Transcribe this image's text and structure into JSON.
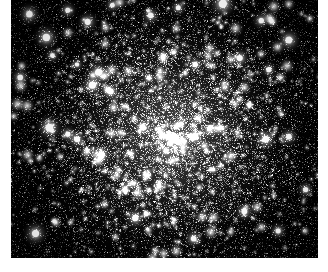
{
  "document": {
    "kind": "astronomical-photograph",
    "subject": "globular star cluster",
    "color_mode": "grayscale",
    "caption": "",
    "alt_text": "Dense grayscale field of thousands of stars forming a globular cluster, brightest and most crowded at the centre and thinning toward the edges, on a black sky background."
  },
  "plate": {
    "x": 11,
    "y": 0,
    "width": 307,
    "height": 258,
    "background_color": "#000000",
    "page_background_color": "#ffffff",
    "margin_left": 11,
    "margin_right": 10,
    "margin_bottom": 14,
    "margin_top": 0
  },
  "image_content": {
    "type": "star-field",
    "cluster_center_x_pct": 52,
    "cluster_center_y_pct": 52,
    "core_radius_pct": 20,
    "halo_radius_pct": 48,
    "faint_star_count": 9000,
    "mid_star_count": 900,
    "bright_star_count": 150,
    "very_bright_star_count": 34,
    "noise_grain_count": 14000,
    "sky_level": 4,
    "peak_brightness": 255,
    "palette": {
      "sky": "#000000",
      "grain_dark": "#0d0d0d",
      "grain_mid": "#3a3a3a",
      "star_faint": "#7a7a7a",
      "star_mid": "#bdbdbd",
      "star_bright": "#ffffff",
      "core_glow": "#969696"
    },
    "bright_stars": [
      {
        "x": 0.06,
        "y": 0.055,
        "r": 3.2,
        "i": 0.92
      },
      {
        "x": 0.115,
        "y": 0.145,
        "r": 3.6,
        "i": 0.98
      },
      {
        "x": 0.185,
        "y": 0.04,
        "r": 2.6,
        "i": 0.8
      },
      {
        "x": 0.25,
        "y": 0.085,
        "r": 3.0,
        "i": 0.88
      },
      {
        "x": 0.33,
        "y": 0.02,
        "r": 2.4,
        "i": 0.76
      },
      {
        "x": 0.455,
        "y": 0.06,
        "r": 2.8,
        "i": 0.84
      },
      {
        "x": 0.545,
        "y": 0.03,
        "r": 2.5,
        "i": 0.78
      },
      {
        "x": 0.69,
        "y": 0.015,
        "r": 4.0,
        "i": 1.0
      },
      {
        "x": 0.815,
        "y": 0.08,
        "r": 2.7,
        "i": 0.82
      },
      {
        "x": 0.905,
        "y": 0.155,
        "r": 3.4,
        "i": 0.95
      },
      {
        "x": 0.03,
        "y": 0.3,
        "r": 2.8,
        "i": 0.85
      },
      {
        "x": 0.135,
        "y": 0.215,
        "r": 2.4,
        "i": 0.74
      },
      {
        "x": 0.285,
        "y": 0.28,
        "r": 3.3,
        "i": 0.93
      },
      {
        "x": 0.265,
        "y": 0.33,
        "r": 3.5,
        "i": 0.96
      },
      {
        "x": 0.215,
        "y": 0.25,
        "r": 2.2,
        "i": 0.72
      },
      {
        "x": 0.325,
        "y": 0.355,
        "r": 2.9,
        "i": 0.87
      },
      {
        "x": 0.6,
        "y": 0.25,
        "r": 2.6,
        "i": 0.8
      },
      {
        "x": 0.745,
        "y": 0.225,
        "r": 3.0,
        "i": 0.88
      },
      {
        "x": 0.84,
        "y": 0.27,
        "r": 2.5,
        "i": 0.77
      },
      {
        "x": 0.125,
        "y": 0.495,
        "r": 3.8,
        "i": 0.99
      },
      {
        "x": 0.185,
        "y": 0.52,
        "r": 2.6,
        "i": 0.79
      },
      {
        "x": 0.215,
        "y": 0.54,
        "r": 2.9,
        "i": 0.86
      },
      {
        "x": 0.295,
        "y": 0.6,
        "r": 3.1,
        "i": 0.9
      },
      {
        "x": 0.43,
        "y": 0.495,
        "r": 2.7,
        "i": 0.83
      },
      {
        "x": 0.505,
        "y": 0.585,
        "r": 2.5,
        "i": 0.78
      },
      {
        "x": 0.6,
        "y": 0.53,
        "r": 3.0,
        "i": 0.89
      },
      {
        "x": 0.83,
        "y": 0.54,
        "r": 3.3,
        "i": 0.92
      },
      {
        "x": 0.905,
        "y": 0.53,
        "r": 2.8,
        "i": 0.84
      },
      {
        "x": 0.96,
        "y": 0.735,
        "r": 2.6,
        "i": 0.8
      },
      {
        "x": 0.08,
        "y": 0.905,
        "r": 3.5,
        "i": 0.96
      },
      {
        "x": 0.405,
        "y": 0.845,
        "r": 3.1,
        "i": 0.9
      },
      {
        "x": 0.595,
        "y": 0.925,
        "r": 2.8,
        "i": 0.85
      },
      {
        "x": 0.76,
        "y": 0.82,
        "r": 2.9,
        "i": 0.87
      },
      {
        "x": 0.87,
        "y": 0.895,
        "r": 2.6,
        "i": 0.79
      }
    ]
  }
}
